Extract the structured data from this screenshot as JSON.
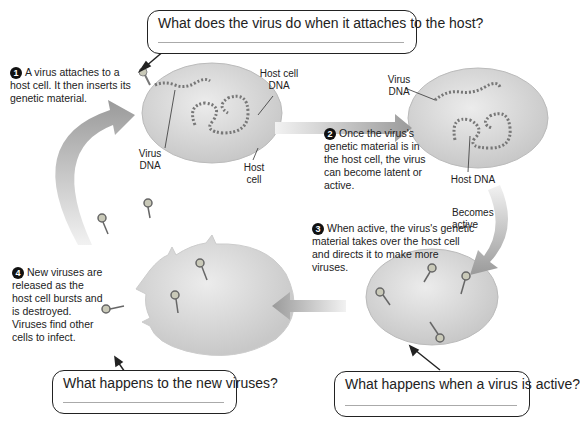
{
  "callouts": {
    "top": {
      "question": "What does the virus do when it attaches to the host?"
    },
    "bottom_left": {
      "question": "What happens to the new viruses?"
    },
    "bottom_right": {
      "question": "What happens when a virus is active?"
    }
  },
  "steps": [
    {
      "number": "1",
      "text": "A virus attaches to a host cell. It then inserts its genetic material."
    },
    {
      "number": "2",
      "text": "Once the virus's genetic material is in the host cell, the virus can become latent or active."
    },
    {
      "number": "3",
      "text": "When active, the virus's genetic material takes over the host cell and directs it to make more viruses."
    },
    {
      "number": "4",
      "text": "New viruses are released as the host cell bursts and is destroyed. Viruses find other cells to infect."
    }
  ],
  "labels": {
    "host_cell_dna": "Host cell DNA",
    "virus_dna_1": "Virus DNA",
    "host_cell": "Host cell",
    "virus_dna_2": "Virus DNA",
    "host_dna": "Host DNA",
    "becomes_active": "Becomes active"
  },
  "colors": {
    "cell_fill": "#d9d9d9",
    "arrow": "#9a9a9a",
    "text": "#222222",
    "step_badge": "#111111"
  }
}
